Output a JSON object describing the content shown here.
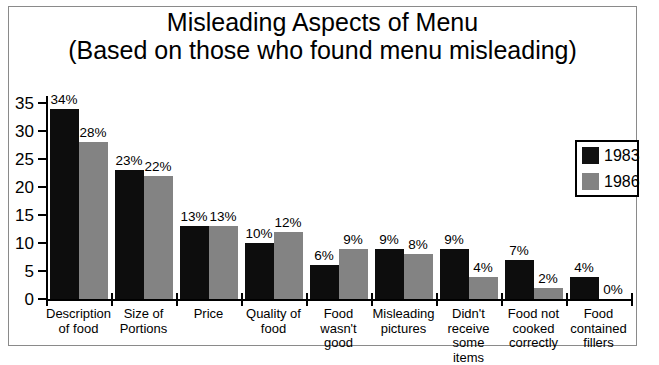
{
  "title": {
    "line1": "Misleading Aspects of Menu",
    "line2": "(Based on those who found menu misleading)"
  },
  "legend": {
    "position": "top-right",
    "items": [
      {
        "label": "1983",
        "color": "#0d0d0d",
        "swatch": "legend-swatch-1983"
      },
      {
        "label": "1986",
        "color": "#838383",
        "swatch": "legend-swatch-1986"
      }
    ]
  },
  "axis": {
    "y_ticks": [
      "35",
      "30",
      "25",
      "20",
      "15",
      "10",
      "5",
      "0"
    ],
    "y_min": 0,
    "y_max": 35,
    "y_step": 5
  },
  "chart_data": {
    "type": "bar",
    "title": "Misleading Aspects of Menu (Based on those who found menu misleading)",
    "xlabel": "",
    "ylabel": "",
    "ylim": [
      0,
      35
    ],
    "grid": false,
    "legend_position": "top-right",
    "categories": [
      "Description of food",
      "Size of Portions",
      "Price",
      "Quality of food",
      "Food wasn't good",
      "Misleading pictures",
      "Didn't receive some items",
      "Food not cooked correctly",
      "Food contained fillers"
    ],
    "category_lines": [
      [
        "Description",
        "of food"
      ],
      [
        "Size of",
        "Portions"
      ],
      [
        "Price"
      ],
      [
        "Quality of",
        "food"
      ],
      [
        "Food",
        "wasn't good"
      ],
      [
        "Misleading",
        "pictures"
      ],
      [
        "Didn't",
        "receive",
        "some items"
      ],
      [
        "Food not",
        "cooked",
        "correctly"
      ],
      [
        "Food",
        "contained",
        "fillers"
      ]
    ],
    "series": [
      {
        "name": "1983",
        "color": "#0d0d0d",
        "values": [
          34,
          23,
          13,
          10,
          6,
          9,
          9,
          7,
          4
        ],
        "labels": [
          "34%",
          "23%",
          "13%",
          "10%",
          "6%",
          "9%",
          "9%",
          "7%",
          "4%"
        ]
      },
      {
        "name": "1986",
        "color": "#838383",
        "values": [
          28,
          22,
          13,
          12,
          9,
          8,
          4,
          2,
          0
        ],
        "labels": [
          "28%",
          "22%",
          "13%",
          "12%",
          "9%",
          "8%",
          "4%",
          "2%",
          "0%"
        ]
      }
    ]
  }
}
